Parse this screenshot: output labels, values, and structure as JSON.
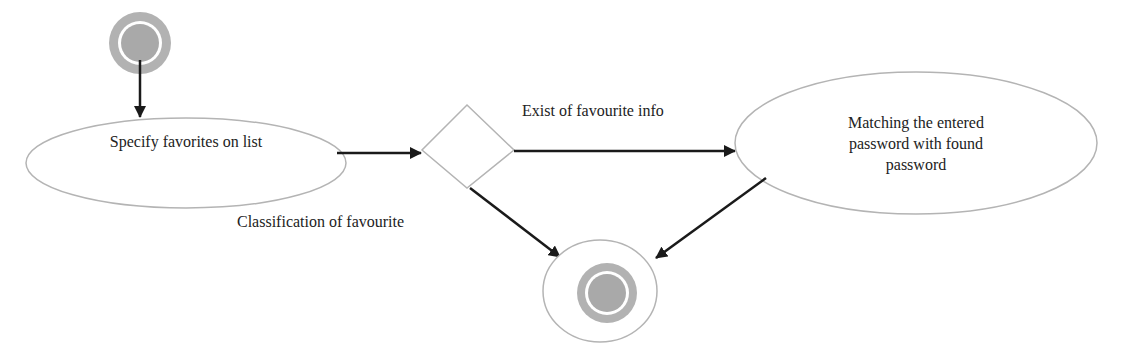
{
  "diagram": {
    "type": "activity-diagram",
    "nodes": {
      "start": {
        "kind": "initial-node"
      },
      "specify": {
        "kind": "activity",
        "label": "Specify favorites on list"
      },
      "decision": {
        "kind": "decision"
      },
      "matching": {
        "kind": "activity",
        "label_lines": [
          "Matching the entered",
          "password with found",
          "password"
        ]
      },
      "end": {
        "kind": "final-node"
      }
    },
    "edges": {
      "start_to_specify": {
        "label": ""
      },
      "specify_to_decision": {
        "label": ""
      },
      "decision_to_matching": {
        "label": "Exist of favourite info"
      },
      "decision_to_end": {
        "label": "Classification of favourite"
      },
      "matching_to_end": {
        "label": ""
      }
    },
    "colors": {
      "outline": "#b4b4b4",
      "node_fill_gray": "#b2b2b2",
      "arrow": "#1a1a1a",
      "background": "#ffffff"
    }
  }
}
